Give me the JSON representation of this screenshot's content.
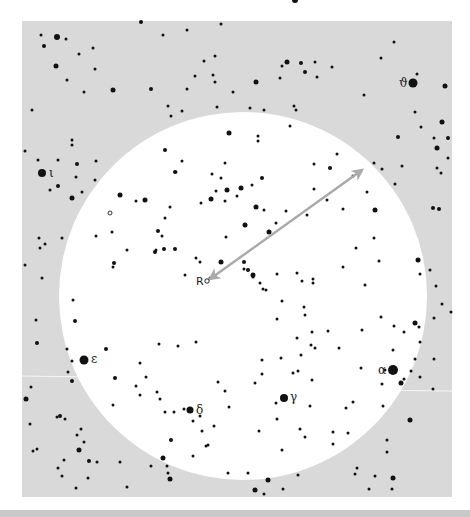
{
  "chart": {
    "background_color": "#d9d9d9",
    "field_color": "#ffffff",
    "star_color": "#111111",
    "arrow_color": "#aaaaaa",
    "sky_box": {
      "x": 22,
      "y": 21,
      "w": 430,
      "h": 476
    },
    "field_circle": {
      "cx": 243,
      "cy": 296,
      "r": 184
    },
    "arrow": {
      "x1": 210,
      "y1": 279,
      "x2": 362,
      "y2": 170,
      "double_headed": true
    },
    "reference_star": {
      "label": "R",
      "x": 207,
      "y": 281,
      "label_x": 196,
      "label_y": 285
    },
    "open_markers": [
      {
        "x": 110,
        "y": 213
      }
    ],
    "named_stars": [
      {
        "name": "alpha",
        "label": "α",
        "x": 393,
        "y": 370,
        "r": 5,
        "label_x": 378,
        "label_y": 374
      },
      {
        "name": "gamma",
        "label": "γ",
        "x": 284,
        "y": 398,
        "r": 4,
        "label_x": 290,
        "label_y": 401
      },
      {
        "name": "delta",
        "label": "δ",
        "x": 190,
        "y": 410,
        "r": 3.5,
        "label_x": 196,
        "label_y": 414
      },
      {
        "name": "epsilon",
        "label": "ε",
        "x": 84,
        "y": 360,
        "r": 4.5,
        "label_x": 91,
        "label_y": 363
      },
      {
        "name": "iota",
        "label": "ι",
        "x": 42,
        "y": 173,
        "r": 4,
        "label_x": 49,
        "label_y": 177
      },
      {
        "name": "theta",
        "label": "ϑ",
        "x": 413,
        "y": 83,
        "r": 4.5,
        "label_x": 399,
        "label_y": 87
      }
    ],
    "stars": [
      [
        295,
        0,
        3
      ],
      [
        41,
        35,
        1.5
      ],
      [
        57,
        37,
        3
      ],
      [
        66,
        39,
        1.5
      ],
      [
        44,
        46,
        2
      ],
      [
        79,
        54,
        1.5
      ],
      [
        93,
        48,
        1.5
      ],
      [
        56,
        66,
        2.5
      ],
      [
        67,
        80,
        1.5
      ],
      [
        95,
        69,
        1.5
      ],
      [
        84,
        92,
        1.5
      ],
      [
        113,
        90,
        2.5
      ],
      [
        141,
        22,
        2
      ],
      [
        163,
        35,
        1.5
      ],
      [
        187,
        30,
        1.5
      ],
      [
        221,
        24,
        1.5
      ],
      [
        151,
        89,
        2
      ],
      [
        32,
        110,
        1.5
      ],
      [
        287,
        62,
        2.5
      ],
      [
        282,
        66,
        1.5
      ],
      [
        301,
        63,
        2
      ],
      [
        315,
        62,
        1.5
      ],
      [
        332,
        67,
        1.5
      ],
      [
        305,
        72,
        2
      ],
      [
        256,
        82,
        2.5
      ],
      [
        317,
        77,
        1.5
      ],
      [
        280,
        78,
        1.5
      ],
      [
        394,
        42,
        1.5
      ],
      [
        381,
        58,
        1.5
      ],
      [
        417,
        74,
        1.5
      ],
      [
        445,
        86,
        2.5
      ],
      [
        204,
        61,
        1.5
      ],
      [
        215,
        56,
        1.5
      ],
      [
        213,
        75,
        1.5
      ],
      [
        187,
        89,
        1.5
      ],
      [
        195,
        76,
        1.5
      ],
      [
        215,
        82,
        1.5
      ],
      [
        233,
        92,
        1.5
      ],
      [
        168,
        106,
        1.5
      ],
      [
        171,
        116,
        1.5
      ],
      [
        182,
        111,
        1.5
      ],
      [
        217,
        107,
        1.5
      ],
      [
        264,
        110,
        1.5
      ],
      [
        250,
        108,
        1.5
      ],
      [
        294,
        106,
        1.5
      ],
      [
        296,
        110,
        1.5
      ],
      [
        364,
        95,
        1.5
      ],
      [
        398,
        137,
        2
      ],
      [
        415,
        112,
        1.5
      ],
      [
        421,
        127,
        1.5
      ],
      [
        434,
        138,
        1.5
      ],
      [
        442,
        122,
        2.5
      ],
      [
        437,
        148,
        2.5
      ],
      [
        448,
        158,
        1.5
      ],
      [
        229,
        133,
        2.5
      ],
      [
        258,
        136,
        1.5
      ],
      [
        258,
        141,
        1.5
      ],
      [
        290,
        126,
        1.5
      ],
      [
        337,
        154,
        1.5
      ],
      [
        330,
        168,
        2
      ],
      [
        314,
        164,
        1.5
      ],
      [
        374,
        163,
        1.5
      ],
      [
        382,
        169,
        1.5
      ],
      [
        402,
        166,
        1.5
      ],
      [
        437,
        168,
        1.5
      ],
      [
        441,
        173,
        1.5
      ],
      [
        395,
        184,
        1.5
      ],
      [
        439,
        209,
        2
      ],
      [
        433,
        208,
        2
      ],
      [
        448,
        138,
        2
      ],
      [
        72,
        140,
        1.5
      ],
      [
        72,
        145,
        1.5
      ],
      [
        58,
        160,
        1.5
      ],
      [
        25,
        151,
        1.5
      ],
      [
        38,
        160,
        1.5
      ],
      [
        77,
        164,
        2
      ],
      [
        96,
        161,
        1.5
      ],
      [
        76,
        177,
        1.5
      ],
      [
        95,
        180,
        1.5
      ],
      [
        58,
        186,
        2
      ],
      [
        50,
        190,
        1.5
      ],
      [
        72,
        198,
        2.5
      ],
      [
        82,
        192,
        1.5
      ],
      [
        120,
        195,
        2.5
      ],
      [
        136,
        201,
        1.5
      ],
      [
        145,
        200,
        2.5
      ],
      [
        165,
        150,
        2
      ],
      [
        175,
        172,
        2
      ],
      [
        212,
        174,
        1.5
      ],
      [
        221,
        178,
        1.5
      ],
      [
        216,
        191,
        1.5
      ],
      [
        170,
        207,
        1.5
      ],
      [
        165,
        218,
        1.5
      ],
      [
        158,
        231,
        2
      ],
      [
        162,
        236,
        1.5
      ],
      [
        156,
        250,
        1.5
      ],
      [
        164,
        249,
        2
      ],
      [
        211,
        199,
        2.5
      ],
      [
        201,
        203,
        1.5
      ],
      [
        226,
        237,
        1.5
      ],
      [
        225,
        201,
        1.5
      ],
      [
        182,
        161,
        1.5
      ],
      [
        176,
        172,
        1.5
      ],
      [
        225,
        163,
        1.5
      ],
      [
        241,
        188,
        2.5
      ],
      [
        262,
        178,
        2
      ],
      [
        252,
        185,
        1.5
      ],
      [
        227,
        190,
        2.5
      ],
      [
        237,
        196,
        1.5
      ],
      [
        256,
        207,
        2.5
      ],
      [
        264,
        210,
        1.5
      ],
      [
        276,
        223,
        1.5
      ],
      [
        245,
        225,
        2.5
      ],
      [
        269,
        232,
        2.5
      ],
      [
        286,
        211,
        1.5
      ],
      [
        307,
        215,
        1.5
      ],
      [
        314,
        189,
        1.5
      ],
      [
        327,
        200,
        1.5
      ],
      [
        353,
        176,
        1.5
      ],
      [
        343,
        209,
        1.5
      ],
      [
        367,
        192,
        1.5
      ],
      [
        375,
        210,
        2.5
      ],
      [
        374,
        238,
        1.5
      ],
      [
        356,
        248,
        1.5
      ],
      [
        112,
        232,
        1.5
      ],
      [
        127,
        250,
        1.5
      ],
      [
        114,
        263,
        2
      ],
      [
        113,
        267,
        1.5
      ],
      [
        96,
        236,
        1.5
      ],
      [
        45,
        244,
        1.5
      ],
      [
        39,
        238,
        1.5
      ],
      [
        40,
        248,
        1.5
      ],
      [
        62,
        238,
        1.5
      ],
      [
        155,
        252,
        2
      ],
      [
        175,
        249,
        2
      ],
      [
        196,
        258,
        1.5
      ],
      [
        221,
        262,
        2.5
      ],
      [
        200,
        262,
        1.5
      ],
      [
        210,
        278,
        1.5
      ],
      [
        185,
        275,
        1.5
      ],
      [
        248,
        270,
        2
      ],
      [
        253,
        277,
        1.5
      ],
      [
        260,
        283,
        1.5
      ],
      [
        277,
        274,
        1.5
      ],
      [
        297,
        273,
        1.5
      ],
      [
        313,
        279,
        1.5
      ],
      [
        302,
        281,
        1.5
      ],
      [
        313,
        283,
        1.5
      ],
      [
        343,
        267,
        1.5
      ],
      [
        365,
        285,
        1.5
      ],
      [
        379,
        261,
        1.5
      ],
      [
        420,
        274,
        1.5
      ],
      [
        418,
        260,
        2.5
      ],
      [
        430,
        270,
        1.5
      ],
      [
        436,
        286,
        1.5
      ],
      [
        434,
        318,
        1.5
      ],
      [
        442,
        304,
        1.5
      ],
      [
        451,
        312,
        1.5
      ],
      [
        25,
        265,
        1.5
      ],
      [
        42,
        278,
        1.5
      ],
      [
        36,
        320,
        1.5
      ],
      [
        37,
        343,
        2
      ],
      [
        73,
        300,
        1.5
      ],
      [
        67,
        349,
        1.5
      ],
      [
        72,
        361,
        1.5
      ],
      [
        68,
        372,
        1.5
      ],
      [
        72,
        381,
        2
      ],
      [
        75,
        321,
        2
      ],
      [
        106,
        349,
        2
      ],
      [
        140,
        363,
        1.5
      ],
      [
        146,
        377,
        1.5
      ],
      [
        159,
        344,
        1.5
      ],
      [
        178,
        346,
        1.5
      ],
      [
        157,
        392,
        1.5
      ],
      [
        196,
        342,
        1.5
      ],
      [
        244,
        262,
        2
      ],
      [
        244,
        269,
        1.5
      ],
      [
        253,
        275,
        2.5
      ],
      [
        263,
        289,
        1.5
      ],
      [
        266,
        290,
        1.5
      ],
      [
        282,
        301,
        1.5
      ],
      [
        277,
        319,
        1.5
      ],
      [
        305,
        315,
        1.5
      ],
      [
        304,
        307,
        1.5
      ],
      [
        297,
        338,
        1.5
      ],
      [
        312,
        332,
        1.5
      ],
      [
        315,
        348,
        1.5
      ],
      [
        328,
        331,
        1.5
      ],
      [
        339,
        348,
        1.5
      ],
      [
        311,
        345,
        1.5
      ],
      [
        301,
        355,
        1.5
      ],
      [
        381,
        317,
        1.5
      ],
      [
        393,
        350,
        1.5
      ],
      [
        394,
        326,
        1.5
      ],
      [
        404,
        332,
        1.5
      ],
      [
        415,
        323,
        2.5
      ],
      [
        419,
        327,
        1.5
      ],
      [
        415,
        359,
        1.5
      ],
      [
        434,
        359,
        1.5
      ],
      [
        420,
        377,
        1.5
      ],
      [
        433,
        389,
        1.5
      ],
      [
        411,
        371,
        1.5
      ],
      [
        404,
        379,
        1.5
      ],
      [
        401,
        383,
        2.5
      ],
      [
        361,
        368,
        1.5
      ],
      [
        362,
        330,
        1.5
      ],
      [
        420,
        342,
        1.5
      ],
      [
        115,
        378,
        2
      ],
      [
        136,
        386,
        1.5
      ],
      [
        113,
        405,
        1.5
      ],
      [
        165,
        412,
        1.5
      ],
      [
        174,
        412,
        1.5
      ],
      [
        160,
        399,
        1.5
      ],
      [
        140,
        395,
        1.5
      ],
      [
        171,
        440,
        2
      ],
      [
        193,
        421,
        1.5
      ],
      [
        229,
        407,
        1.5
      ],
      [
        218,
        382,
        1.5
      ],
      [
        225,
        391,
        1.5
      ],
      [
        184,
        409,
        1.5
      ],
      [
        200,
        416,
        1.5
      ],
      [
        202,
        431,
        1.5
      ],
      [
        214,
        426,
        1.5
      ],
      [
        206,
        446,
        1.5
      ],
      [
        208,
        445,
        1.5
      ],
      [
        255,
        383,
        1.5
      ],
      [
        262,
        360,
        1.5
      ],
      [
        281,
        358,
        1.5
      ],
      [
        298,
        371,
        1.5
      ],
      [
        293,
        373,
        1.5
      ],
      [
        312,
        380,
        1.5
      ],
      [
        310,
        406,
        1.5
      ],
      [
        276,
        403,
        1.5
      ],
      [
        300,
        429,
        1.5
      ],
      [
        277,
        419,
        1.5
      ],
      [
        305,
        437,
        1.5
      ],
      [
        353,
        402,
        1.5
      ],
      [
        259,
        431,
        1.5
      ],
      [
        282,
        450,
        1.5
      ],
      [
        333,
        432,
        1.5
      ],
      [
        262,
        374,
        1.5
      ],
      [
        26,
        399,
        2.5
      ],
      [
        31,
        387,
        1.5
      ],
      [
        30,
        424,
        1.5
      ],
      [
        37,
        449,
        1.5
      ],
      [
        33,
        451,
        1.5
      ],
      [
        60,
        416,
        2
      ],
      [
        65,
        419,
        1.5
      ],
      [
        57,
        417,
        1.5
      ],
      [
        77,
        435,
        1.5
      ],
      [
        81,
        429,
        1.5
      ],
      [
        79,
        450,
        2.5
      ],
      [
        84,
        442,
        1.5
      ],
      [
        64,
        460,
        1.5
      ],
      [
        58,
        468,
        1.5
      ],
      [
        62,
        476,
        1.5
      ],
      [
        76,
        488,
        1.5
      ],
      [
        88,
        478,
        1.5
      ],
      [
        89,
        461,
        2
      ],
      [
        97,
        462,
        1.5
      ],
      [
        120,
        462,
        1.5
      ],
      [
        127,
        487,
        1.5
      ],
      [
        151,
        466,
        1.5
      ],
      [
        163,
        458,
        2.5
      ],
      [
        167,
        466,
        1.5
      ],
      [
        168,
        473,
        1.5
      ],
      [
        170,
        479,
        2.5
      ],
      [
        193,
        456,
        1.5
      ],
      [
        228,
        473,
        1.5
      ],
      [
        248,
        473,
        1.5
      ],
      [
        255,
        490,
        2.5
      ],
      [
        264,
        494,
        1.5
      ],
      [
        268,
        480,
        2.5
      ],
      [
        283,
        489,
        1.5
      ],
      [
        346,
        408,
        1.5
      ],
      [
        383,
        406,
        1.5
      ],
      [
        385,
        370,
        1.5
      ],
      [
        382,
        384,
        1.5
      ],
      [
        348,
        433,
        1.5
      ],
      [
        387,
        452,
        1.5
      ],
      [
        375,
        476,
        1.5
      ],
      [
        393,
        478,
        2.5
      ],
      [
        410,
        420,
        2.5
      ],
      [
        392,
        489,
        1.5
      ],
      [
        369,
        489,
        1.5
      ],
      [
        298,
        475,
        1.5
      ],
      [
        333,
        444,
        1.5
      ],
      [
        387,
        440,
        1.5
      ],
      [
        357,
        468,
        1.5
      ],
      [
        355,
        474,
        1.5
      ]
    ]
  }
}
